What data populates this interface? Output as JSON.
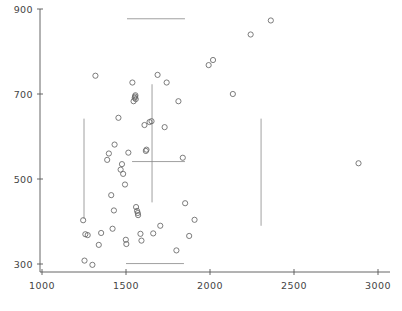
{
  "chart_data": {
    "type": "scatter",
    "title": "",
    "subtitle": "",
    "xlabel": "",
    "ylabel": "",
    "xlim": [
      1000,
      3050
    ],
    "ylim": [
      290,
      900
    ],
    "grid": false,
    "legend": null,
    "x_ticks": [
      1000,
      1500,
      2000,
      2500,
      3000
    ],
    "x_tick_labels": [
      "1000",
      "1500",
      "2000",
      "2500",
      "3000"
    ],
    "y_ticks": [
      300,
      500,
      700,
      900
    ],
    "y_tick_labels": [
      "300",
      "500",
      "700",
      "900"
    ],
    "marker": {
      "shape": "open-circle",
      "radius": 2.6,
      "stroke": "#666666",
      "fill": "none"
    },
    "points": [
      [
        1245,
        403
      ],
      [
        1253,
        308
      ],
      [
        1258,
        370
      ],
      [
        1272,
        368
      ],
      [
        1300,
        298
      ],
      [
        1318,
        743
      ],
      [
        1338,
        345
      ],
      [
        1352,
        373
      ],
      [
        1388,
        545
      ],
      [
        1398,
        560
      ],
      [
        1412,
        462
      ],
      [
        1420,
        383
      ],
      [
        1428,
        426
      ],
      [
        1432,
        581
      ],
      [
        1455,
        644
      ],
      [
        1468,
        522
      ],
      [
        1476,
        535
      ],
      [
        1483,
        512
      ],
      [
        1494,
        487
      ],
      [
        1499,
        357
      ],
      [
        1502,
        347
      ],
      [
        1514,
        562
      ],
      [
        1538,
        727
      ],
      [
        1545,
        683
      ],
      [
        1552,
        691
      ],
      [
        1554,
        694
      ],
      [
        1556,
        697
      ],
      [
        1558,
        688
      ],
      [
        1560,
        434
      ],
      [
        1566,
        425
      ],
      [
        1570,
        420
      ],
      [
        1572,
        415
      ],
      [
        1586,
        371
      ],
      [
        1592,
        355
      ],
      [
        1610,
        627
      ],
      [
        1618,
        566
      ],
      [
        1622,
        569
      ],
      [
        1640,
        634
      ],
      [
        1652,
        636
      ],
      [
        1662,
        372
      ],
      [
        1688,
        745
      ],
      [
        1704,
        390
      ],
      [
        1730,
        622
      ],
      [
        1742,
        727
      ],
      [
        1800,
        332
      ],
      [
        1812,
        683
      ],
      [
        1838,
        550
      ],
      [
        1852,
        443
      ],
      [
        1876,
        366
      ],
      [
        1908,
        404
      ],
      [
        1992,
        768
      ],
      [
        2018,
        780
      ],
      [
        2136,
        700
      ],
      [
        2242,
        840
      ],
      [
        2362,
        873
      ],
      [
        2884,
        537
      ]
    ],
    "reference_lines": [
      {
        "name": "upper-horizontal-reference",
        "orientation": "horizontal",
        "y": 877,
        "x_start": 1506,
        "x_end": 1851
      },
      {
        "name": "lower-horizontal-reference",
        "orientation": "horizontal",
        "y": 301,
        "x_start": 1500,
        "x_end": 1845
      },
      {
        "name": "mean-horizontal-crosshair",
        "orientation": "horizontal",
        "y": 541,
        "x_start": 1536,
        "x_end": 1851
      },
      {
        "name": "mean-vertical-crosshair",
        "orientation": "vertical",
        "x": 1655,
        "y_start": 445,
        "y_end": 723
      },
      {
        "name": "left-vertical-reference",
        "orientation": "vertical",
        "x": 1250,
        "y_start": 406,
        "y_end": 642
      },
      {
        "name": "right-vertical-reference",
        "orientation": "vertical",
        "x": 2304,
        "y_start": 390,
        "y_end": 642
      }
    ],
    "geometry": {
      "plot_left_px": 42,
      "plot_right_px": 378,
      "x_min_value": 1000,
      "x_max_value": 3000,
      "y_top_px": 9,
      "y_bottom_px": 264,
      "y_top_value": 900,
      "y_bottom_value": 300,
      "axis_x_px": 40,
      "axis_y_px": 272,
      "axis_top_px": 9,
      "axis_right_px": 390
    },
    "colors": {
      "axis": "#555555",
      "marker_stroke": "#666666",
      "reference_line": "#888888",
      "tick_text": "#444444",
      "background": "#ffffff"
    }
  }
}
